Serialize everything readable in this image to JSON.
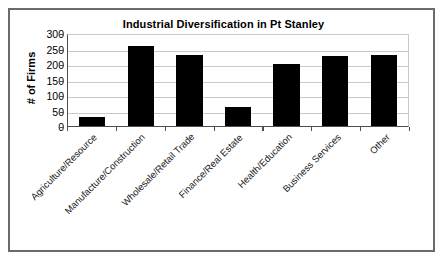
{
  "chart_data": {
    "type": "bar",
    "title": "Industrial Diversification in Pt Stanley",
    "xlabel": "",
    "ylabel": "# of Firms",
    "ylim": [
      0,
      300
    ],
    "yticks": [
      0,
      50,
      100,
      150,
      200,
      250,
      300
    ],
    "ytick_labels": [
      "0",
      "50",
      "100",
      "150",
      "200",
      "250",
      "300"
    ],
    "grid": true,
    "legend": false,
    "bar_color": "#000000",
    "categories": [
      "Agriculture/Resource",
      "Manufacture/Construction",
      "Wholesale/Retail Trade",
      "Finance/Real Estate",
      "Health/Education",
      "Business Services",
      "Other"
    ],
    "values": [
      30,
      258,
      230,
      62,
      201,
      225,
      230
    ]
  },
  "frame": {
    "border_color": "#6b6b6b",
    "background": "#ffffff"
  }
}
